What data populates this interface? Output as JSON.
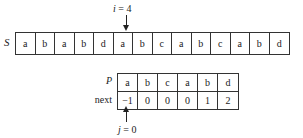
{
  "pointer_i": {
    "var": "i",
    "eq": " = ",
    "value": "4"
  },
  "string_S": {
    "label": "S",
    "cells": [
      "a",
      "b",
      "a",
      "b",
      "d",
      "a",
      "b",
      "c",
      "a",
      "b",
      "c",
      "a",
      "b",
      "d"
    ]
  },
  "pattern_P": {
    "label": "P",
    "cells": [
      "a",
      "b",
      "c",
      "a",
      "b",
      "d"
    ]
  },
  "next_array": {
    "label": "next",
    "cells": [
      "−1",
      "0",
      "0",
      "0",
      "1",
      "2"
    ]
  },
  "pointer_j": {
    "var": "j",
    "eq": " = ",
    "value": "0"
  }
}
